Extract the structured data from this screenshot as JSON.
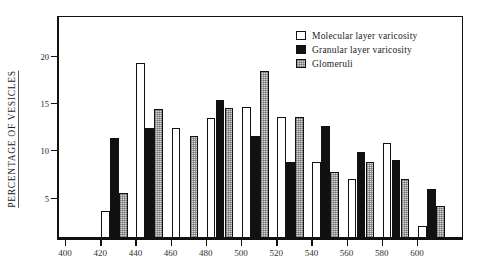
{
  "chart_data": {
    "type": "bar",
    "title": "",
    "xlabel": "",
    "ylabel": "PERCENTAGE  OF  VESICLES",
    "categories": [
      "400",
      "420",
      "440",
      "460",
      "480",
      "500",
      "520",
      "540",
      "560",
      "580",
      "600"
    ],
    "xticks": [
      "400",
      "420",
      "440",
      "460",
      "480",
      "500",
      "520",
      "540",
      "560",
      "580",
      "600"
    ],
    "yticks": [
      "5",
      "10",
      "15",
      "20"
    ],
    "ylim": [
      0,
      23.5
    ],
    "grid": false,
    "legend_position": "top-right",
    "series": [
      {
        "name": "Molecular layer varicosity",
        "color": "#ffffff",
        "fill": "white",
        "values": [
          0,
          3.0,
          19.2,
          12.1,
          13.2,
          14.4,
          13.3,
          8.4,
          6.5,
          10.4,
          1.3
        ]
      },
      {
        "name": "Granular layer varicosity",
        "color": "#111111",
        "fill": "black",
        "values": [
          0,
          11.0,
          12.1,
          0,
          15.2,
          11.2,
          8.3,
          12.3,
          9.5,
          8.6,
          5.4
        ]
      },
      {
        "name": "Glomeruli",
        "color": "#d9d9d9",
        "fill": "stippled",
        "values": [
          0,
          5.0,
          14.2,
          11.2,
          14.3,
          18.4,
          13.3,
          7.3,
          8.4,
          6.5,
          3.5
        ]
      }
    ]
  },
  "legend": {
    "items": [
      {
        "label": "Molecular layer varicosity",
        "fill": "white"
      },
      {
        "label": "Granular layer varicosity",
        "fill": "black"
      },
      {
        "label": "Glomeruli",
        "fill": "gray"
      }
    ]
  },
  "axes": {
    "y_title": "PERCENTAGE  OF  VESICLES",
    "y_tick_labels": [
      "20",
      "15",
      "10",
      "5"
    ],
    "x_tick_labels": [
      "400",
      "420",
      "440",
      "460",
      "480",
      "500",
      "520",
      "540",
      "560",
      "580",
      "600"
    ]
  }
}
